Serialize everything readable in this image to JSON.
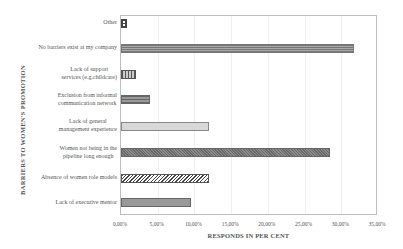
{
  "chart_data": {
    "type": "bar",
    "orientation": "horizontal",
    "title": "",
    "xlabel": "RESPONDS IN PER CENT",
    "ylabel": "BARRIERS TO WOMEN'S PROMOTION",
    "xlim": [
      0,
      35
    ],
    "x_ticks": [
      "0,00%",
      "5,00%",
      "10,00%",
      "15,00%",
      "20,00%",
      "25,00%",
      "30,00%",
      "35,00%"
    ],
    "grid": true,
    "legend": null,
    "categories": [
      "Other",
      "No barriers exist at my company",
      "Lack of support services (e.g.childcare)",
      "Exclusion from informal communication network",
      "Lack of general management experience",
      "Women not being in the pipeline long enough",
      "Absence of women role models",
      "Lack of executive mentor"
    ],
    "values": [
      0.8,
      31.7,
      2.0,
      4.0,
      12.0,
      28.5,
      12.0,
      9.5
    ]
  },
  "labels": {
    "cat0": [
      "Other"
    ],
    "cat1": [
      "No barriers exist at my company"
    ],
    "cat2": [
      "Lack of support",
      "services (e.g.childcare)"
    ],
    "cat3": [
      "Exclusion from informal",
      "communication network"
    ],
    "cat4": [
      "Lack of general",
      "management experience"
    ],
    "cat5": [
      "Women not being in the",
      "pipeline long enough"
    ],
    "cat6": [
      "Absence of women role models"
    ],
    "cat7": [
      "Lack of executive mentor"
    ]
  }
}
